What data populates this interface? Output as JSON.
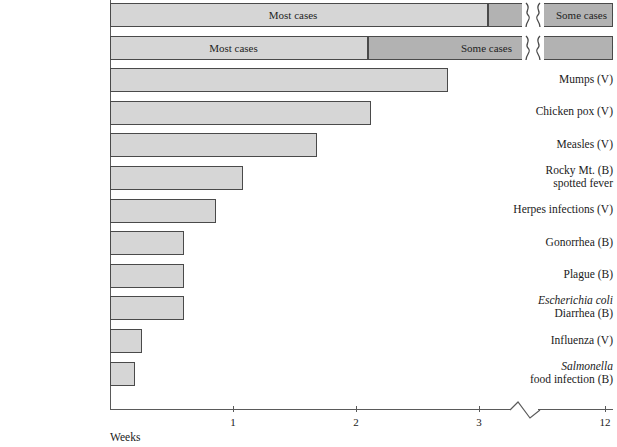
{
  "chart_data": {
    "type": "bar",
    "title": "",
    "xlabel": "Weeks",
    "ylabel": "",
    "xlim": [
      0,
      3.45
    ],
    "grid": false,
    "legend": null,
    "axis_break": {
      "after": 3.25,
      "resumes_at": 12,
      "style": "zigzag"
    },
    "tick_values": [
      1,
      2,
      3,
      12
    ],
    "tick_labels": [
      "1",
      "2",
      "3",
      "12"
    ],
    "segment_labels": {
      "most": "Most cases",
      "some": "Some cases"
    },
    "segment_colors": {
      "most": "#d6d6d6",
      "some": "#b2b2b2",
      "outline": "#4a4a4a"
    },
    "categories": [
      "Rabies in Dogs (V)",
      "Primary syphilis (B)",
      "Mumps (V)",
      "Chicken pox (V)",
      "Measles (V)",
      "Rocky Mt. (B) spotted fever",
      "Herpes infections (V)",
      "Gonorrhea (B)",
      "Plague (B)",
      "Escherichia coli Diarrhea (B)",
      "Influenza (V)",
      "Salmonella food infection (B)"
    ],
    "values": [
      12,
      12,
      2.75,
      2.12,
      1.68,
      1.08,
      0.86,
      0.6,
      0.6,
      0.6,
      0.26,
      0.2
    ],
    "rows": [
      {
        "label_lines": [
          {
            "text": "Rabies in Dogs (V)",
            "italic": false
          }
        ],
        "value": 12,
        "broken": true,
        "segments": [
          {
            "kind": "most",
            "start": 0,
            "end": 3.07,
            "label": "Most cases"
          },
          {
            "kind": "some",
            "start": 3.07,
            "end": 3.25,
            "label": ""
          },
          {
            "kind": "some",
            "start": 3.3,
            "end": 3.45,
            "label": "Some cases"
          }
        ]
      },
      {
        "label_lines": [
          {
            "text": "Primary syphilis (B)",
            "italic": false
          }
        ],
        "value": 12,
        "broken": true,
        "segments": [
          {
            "kind": "most",
            "start": 0,
            "end": 2.1,
            "label": "Most cases"
          },
          {
            "kind": "some",
            "start": 2.1,
            "end": 3.25,
            "label": "Some cases"
          },
          {
            "kind": "some",
            "start": 3.3,
            "end": 3.45,
            "label": ""
          }
        ]
      },
      {
        "label_lines": [
          {
            "text": "Mumps (V)",
            "italic": false
          }
        ],
        "value": 2.75,
        "broken": false,
        "segments": [
          {
            "kind": "most",
            "start": 0,
            "end": 2.75,
            "label": ""
          }
        ]
      },
      {
        "label_lines": [
          {
            "text": "Chicken pox (V)",
            "italic": false
          }
        ],
        "value": 2.12,
        "broken": false,
        "segments": [
          {
            "kind": "most",
            "start": 0,
            "end": 2.12,
            "label": ""
          }
        ]
      },
      {
        "label_lines": [
          {
            "text": "Measles (V)",
            "italic": false
          }
        ],
        "value": 1.68,
        "broken": false,
        "segments": [
          {
            "kind": "most",
            "start": 0,
            "end": 1.68,
            "label": ""
          }
        ]
      },
      {
        "label_lines": [
          {
            "text": "Rocky Mt. (B)",
            "italic": false
          },
          {
            "text": "spotted fever",
            "italic": false
          }
        ],
        "value": 1.08,
        "broken": false,
        "segments": [
          {
            "kind": "most",
            "start": 0,
            "end": 1.08,
            "label": ""
          }
        ]
      },
      {
        "label_lines": [
          {
            "text": "Herpes infections (V)",
            "italic": false
          }
        ],
        "value": 0.86,
        "broken": false,
        "segments": [
          {
            "kind": "most",
            "start": 0,
            "end": 0.86,
            "label": ""
          }
        ]
      },
      {
        "label_lines": [
          {
            "text": "Gonorrhea (B)",
            "italic": false
          }
        ],
        "value": 0.6,
        "broken": false,
        "segments": [
          {
            "kind": "most",
            "start": 0,
            "end": 0.6,
            "label": ""
          }
        ]
      },
      {
        "label_lines": [
          {
            "text": "Plague (B)",
            "italic": false
          }
        ],
        "value": 0.6,
        "broken": false,
        "segments": [
          {
            "kind": "most",
            "start": 0,
            "end": 0.6,
            "label": ""
          }
        ]
      },
      {
        "label_lines": [
          {
            "text": "Escherichia coli",
            "italic": true
          },
          {
            "text": "Diarrhea (B)",
            "italic": false
          }
        ],
        "value": 0.6,
        "broken": false,
        "segments": [
          {
            "kind": "most",
            "start": 0,
            "end": 0.6,
            "label": ""
          }
        ]
      },
      {
        "label_lines": [
          {
            "text": "Influenza (V)",
            "italic": false
          }
        ],
        "value": 0.26,
        "broken": false,
        "segments": [
          {
            "kind": "most",
            "start": 0,
            "end": 0.26,
            "label": ""
          }
        ]
      },
      {
        "label_lines": [
          {
            "text": "Salmonella",
            "italic": true
          },
          {
            "text": "food infection (B)",
            "italic": false
          }
        ],
        "value": 0.2,
        "broken": false,
        "segments": [
          {
            "kind": "most",
            "start": 0,
            "end": 0.2,
            "label": ""
          }
        ]
      }
    ]
  }
}
